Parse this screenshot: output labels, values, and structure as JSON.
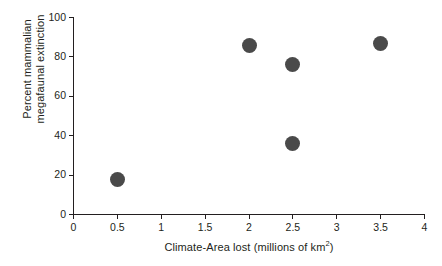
{
  "chart_data": {
    "type": "scatter",
    "title": "",
    "xlabel": "Climate-Area lost (millions of km²)",
    "ylabel": "Percent mammalian megafaunal extinction",
    "ylabel_line1": "Percent mammalian",
    "ylabel_line2": "megafaunal extinction",
    "xlabel_text": "Climate-Area lost (millions of km",
    "xlabel_superscript": "2",
    "xlabel_suffix": ")",
    "xlim": [
      0,
      4
    ],
    "ylim": [
      0,
      100
    ],
    "xticks": [
      0,
      0.5,
      1,
      1.5,
      2,
      2.5,
      3,
      3.5,
      4
    ],
    "xtick_labels": [
      "0",
      "0.5",
      "1",
      "1.5",
      "2",
      "2.5",
      "3",
      "3.5",
      "4"
    ],
    "yticks": [
      0,
      20,
      40,
      60,
      80,
      100
    ],
    "ytick_labels": [
      "0",
      "20",
      "40",
      "60",
      "80",
      "100"
    ],
    "grid": false,
    "legend": false,
    "marker_color": "#4a4a4a",
    "marker_size_px": 15,
    "axis_color": "#231f20",
    "background": "#ffffff",
    "points": [
      {
        "x": 0.5,
        "y": 18
      },
      {
        "x": 2.0,
        "y": 86
      },
      {
        "x": 2.5,
        "y": 76
      },
      {
        "x": 2.5,
        "y": 36
      },
      {
        "x": 3.5,
        "y": 87
      }
    ]
  }
}
